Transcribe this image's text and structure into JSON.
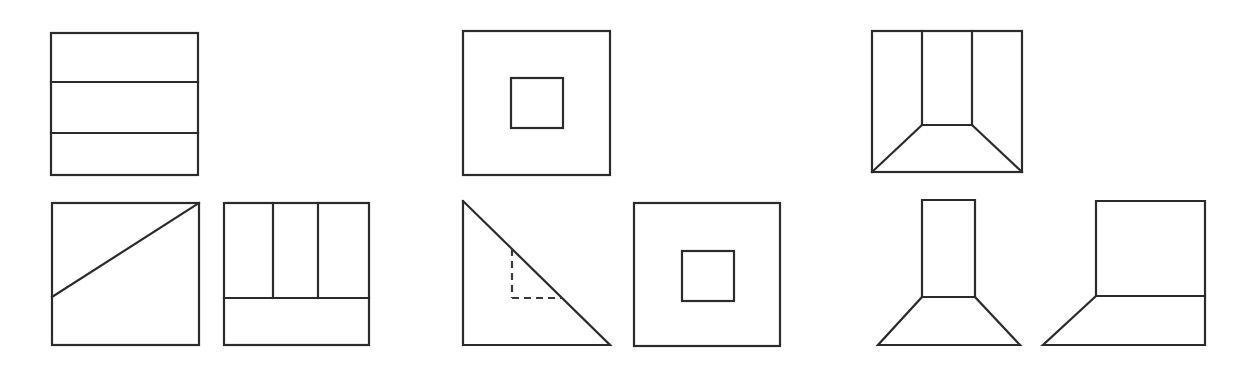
{
  "page": {
    "background_color": "#ffffff",
    "stroke_color": "#2b2b2b",
    "dashed_stroke_color": "#3a3a3a",
    "width": 1247,
    "height": 372,
    "row_count": 2,
    "figure_count": 9
  },
  "figures": [
    {
      "id": "fig-1",
      "name": "square-with-three-horizontal-bands",
      "row": "top",
      "column": 1,
      "description": "Square divided by two horizontal lines into three horizontal bands",
      "bounds": {
        "x": 51,
        "y": 33,
        "w": 147,
        "h": 142
      },
      "shapes": [
        {
          "type": "rect",
          "x": 51,
          "y": 33,
          "w": 147,
          "h": 142,
          "style": "solid"
        },
        {
          "type": "line",
          "x1": 51,
          "y1": 82,
          "x2": 198,
          "y2": 82,
          "style": "solid"
        },
        {
          "type": "line",
          "x1": 51,
          "y1": 133,
          "x2": 198,
          "y2": 133,
          "style": "solid"
        }
      ]
    },
    {
      "id": "fig-2",
      "name": "square-with-concentric-inner-square",
      "row": "top",
      "column": 2,
      "description": "Large square containing a small square above and left of center",
      "bounds": {
        "x": 463,
        "y": 31,
        "w": 147,
        "h": 144
      },
      "shapes": [
        {
          "type": "rect",
          "x": 463,
          "y": 31,
          "w": 147,
          "h": 144,
          "style": "solid"
        },
        {
          "type": "rect",
          "x": 511,
          "y": 78,
          "w": 52,
          "h": 50,
          "style": "solid"
        }
      ]
    },
    {
      "id": "fig-3",
      "name": "square-with-corridor-perspective",
      "row": "top",
      "column": 3,
      "description": "Square with an inner vertical rectangle open at the top and two diagonals to the bottom corners, giving a corridor perspective",
      "bounds": {
        "x": 872,
        "y": 31,
        "w": 150,
        "h": 141
      },
      "shapes": [
        {
          "type": "rect",
          "x": 872,
          "y": 31,
          "w": 150,
          "h": 141,
          "style": "solid"
        },
        {
          "type": "line",
          "x1": 922,
          "y1": 31,
          "x2": 922,
          "y2": 125,
          "style": "solid"
        },
        {
          "type": "line",
          "x1": 972,
          "y1": 31,
          "x2": 972,
          "y2": 125,
          "style": "solid"
        },
        {
          "type": "line",
          "x1": 922,
          "y1": 125,
          "x2": 972,
          "y2": 125,
          "style": "solid"
        },
        {
          "type": "line",
          "x1": 922,
          "y1": 125,
          "x2": 872,
          "y2": 172,
          "style": "solid"
        },
        {
          "type": "line",
          "x1": 972,
          "y1": 125,
          "x2": 1022,
          "y2": 172,
          "style": "solid"
        }
      ]
    },
    {
      "id": "fig-4",
      "name": "square-with-diagonal",
      "row": "bottom",
      "column": 1,
      "description": "Square with a single diagonal line from the left edge to the top-right corner",
      "bounds": {
        "x": 52,
        "y": 203,
        "w": 147,
        "h": 142
      },
      "shapes": [
        {
          "type": "rect",
          "x": 52,
          "y": 203,
          "w": 147,
          "h": 142,
          "style": "solid"
        },
        {
          "type": "line",
          "x1": 52,
          "y1": 297,
          "x2": 199,
          "y2": 203,
          "style": "solid"
        }
      ]
    },
    {
      "id": "fig-5",
      "name": "square-with-two-vertical-slots",
      "row": "bottom",
      "column": 2,
      "description": "Square with two vertical lines descending from the top edge and a full-width horizontal line at two thirds height",
      "bounds": {
        "x": 224,
        "y": 203,
        "w": 145,
        "h": 142
      },
      "shapes": [
        {
          "type": "rect",
          "x": 224,
          "y": 203,
          "w": 145,
          "h": 142,
          "style": "solid"
        },
        {
          "type": "line",
          "x1": 273,
          "y1": 203,
          "x2": 273,
          "y2": 298,
          "style": "solid"
        },
        {
          "type": "line",
          "x1": 318,
          "y1": 203,
          "x2": 318,
          "y2": 298,
          "style": "solid"
        },
        {
          "type": "line",
          "x1": 224,
          "y1": 298,
          "x2": 369,
          "y2": 298,
          "style": "solid"
        }
      ]
    },
    {
      "id": "fig-6",
      "name": "right-triangle-with-dashed-inscribed-square",
      "row": "bottom",
      "column": 3,
      "description": "Right triangle with the right angle at bottom-left and a dashed square inscribed touching the hypotenuse",
      "bounds": {
        "x": 463,
        "y": 201,
        "w": 147,
        "h": 144
      },
      "shapes": [
        {
          "type": "polyline",
          "points": "463,201 463,345 610,345 463,201",
          "style": "solid"
        },
        {
          "type": "line",
          "x1": 512,
          "y1": 249,
          "x2": 512,
          "y2": 298,
          "style": "dashed"
        },
        {
          "type": "line",
          "x1": 512,
          "y1": 298,
          "x2": 562,
          "y2": 298,
          "style": "dashed"
        }
      ]
    },
    {
      "id": "fig-7",
      "name": "square-with-centered-inner-square",
      "row": "bottom",
      "column": 4,
      "description": "Large square containing a centered small square",
      "bounds": {
        "x": 634,
        "y": 203,
        "w": 146,
        "h": 143
      },
      "shapes": [
        {
          "type": "rect",
          "x": 634,
          "y": 203,
          "w": 146,
          "h": 143,
          "style": "solid"
        },
        {
          "type": "rect",
          "x": 682,
          "y": 251,
          "w": 52,
          "h": 50,
          "style": "solid"
        }
      ]
    },
    {
      "id": "fig-8",
      "name": "corridor-shape-without-frame",
      "row": "bottom",
      "column": 5,
      "description": "Vertical rectangle flaring into a trapezoid base, the corridor shape with the outer square removed",
      "bounds": {
        "x": 878,
        "y": 200,
        "w": 142,
        "h": 145
      },
      "shapes": [
        {
          "type": "polyline",
          "points": "922,200 922,297 878,345 1020,345 975,297 975,200 922,200",
          "style": "solid"
        },
        {
          "type": "line",
          "x1": 922,
          "y1": 297,
          "x2": 975,
          "y2": 297,
          "style": "solid"
        }
      ]
    },
    {
      "id": "fig-9",
      "name": "square-with-trapezoid-base",
      "row": "bottom",
      "column": 6,
      "description": "Square at top-right with a diagonal dropping from its bottom-left corner to a baseline, forming a trapezoid below",
      "bounds": {
        "x": 1043,
        "y": 201,
        "w": 162,
        "h": 144
      },
      "shapes": [
        {
          "type": "polyline",
          "points": "1096,201 1096,296 1043,345 1205,345 1205,201 1096,201",
          "style": "solid"
        },
        {
          "type": "line",
          "x1": 1096,
          "y1": 296,
          "x2": 1205,
          "y2": 296,
          "style": "solid"
        }
      ]
    }
  ]
}
